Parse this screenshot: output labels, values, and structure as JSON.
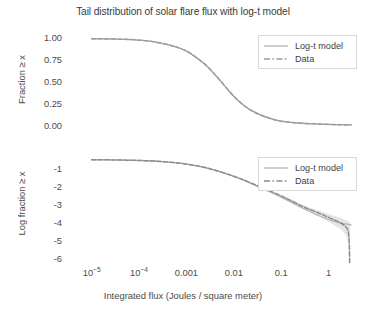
{
  "chart_data": {
    "type": "line",
    "title": "Tail distribution of solar flare flux with log-t model",
    "xlabel": "Integrated flux (Joules / square meter)",
    "xscale": "log",
    "xlim": [
      3.16e-06,
      4.0
    ],
    "xticks": [
      1e-05,
      0.0001,
      0.001,
      0.01,
      0.1,
      1
    ],
    "xticklabels": [
      "10−5",
      "10−4",
      "0.001",
      "0.01",
      "0.1",
      "1"
    ],
    "grid": false,
    "legend_position": "upper right",
    "panels": [
      {
        "name": "linear-tail-distribution",
        "ylabel": "Fraction ≥ x",
        "ylim": [
          -0.04,
          1.06
        ],
        "yticks": [
          0.0,
          0.25,
          0.5,
          0.75,
          1.0
        ],
        "yticklabels": [
          "0.00",
          "0.25",
          "0.50",
          "0.75",
          "1.00"
        ],
        "series": [
          {
            "name": "Log-t model",
            "style": "solid",
            "color": "#b5b5b5",
            "x": [
              1e-05,
              2e-05,
              5e-05,
              0.0001,
              0.0002,
              0.0005,
              0.001,
              0.002,
              0.003,
              0.005,
              0.008,
              0.012,
              0.02,
              0.035,
              0.06,
              0.1,
              0.2,
              0.4,
              0.8,
              1.5,
              3.0
            ],
            "y": [
              0.995,
              0.993,
              0.988,
              0.979,
              0.962,
              0.915,
              0.855,
              0.745,
              0.66,
              0.53,
              0.4,
              0.3,
              0.205,
              0.135,
              0.09,
              0.06,
              0.042,
              0.032,
              0.026,
              0.022,
              0.02
            ]
          },
          {
            "name": "Data",
            "style": "dashed",
            "color": "#9a9a9a",
            "x": [
              1e-05,
              2e-05,
              5e-05,
              0.0001,
              0.0002,
              0.0005,
              0.001,
              0.002,
              0.003,
              0.005,
              0.008,
              0.012,
              0.02,
              0.035,
              0.06,
              0.1,
              0.2,
              0.4,
              0.8,
              1.5,
              3.0
            ],
            "y": [
              0.995,
              0.993,
              0.988,
              0.979,
              0.962,
              0.915,
              0.855,
              0.745,
              0.66,
              0.53,
              0.4,
              0.3,
              0.205,
              0.135,
              0.09,
              0.06,
              0.042,
              0.032,
              0.026,
              0.02,
              0.016
            ]
          }
        ]
      },
      {
        "name": "log-tail-distribution",
        "ylabel": "Log fraction ≥ x",
        "ylim": [
          -6.4,
          -0.25
        ],
        "yticks": [
          -6,
          -5,
          -4,
          -3,
          -2,
          -1
        ],
        "yticklabels": [
          "-6",
          "-5",
          "-4",
          "-3",
          "-2",
          "-1"
        ],
        "series": [
          {
            "name": "Log-t model",
            "style": "solid",
            "color": "#b5b5b5",
            "x": [
              1e-05,
              3e-05,
              0.0001,
              0.0003,
              0.001,
              0.003,
              0.01,
              0.03,
              0.1,
              0.3,
              0.6,
              1.0,
              1.6,
              2.4,
              3.0
            ],
            "y": [
              -0.46,
              -0.47,
              -0.5,
              -0.56,
              -0.7,
              -0.95,
              -1.39,
              -1.92,
              -2.55,
              -3.2,
              -3.56,
              -3.8,
              -3.96,
              -4.06,
              -4.1
            ]
          },
          {
            "name": "Data",
            "style": "dashed",
            "color": "#8c8c8c",
            "x": [
              1e-05,
              3e-05,
              0.0001,
              0.0003,
              0.001,
              0.003,
              0.01,
              0.03,
              0.1,
              0.3,
              0.6,
              1.0,
              1.6,
              2.2,
              2.6,
              2.75,
              2.8
            ],
            "y": [
              -0.46,
              -0.47,
              -0.5,
              -0.56,
              -0.7,
              -0.95,
              -1.38,
              -1.88,
              -2.48,
              -3.1,
              -3.42,
              -3.68,
              -3.92,
              -4.15,
              -4.45,
              -5.2,
              -6.2
            ]
          }
        ],
        "confidence_band": {
          "name": "Data uncertainty band",
          "color": "#cfcfcf",
          "x": [
            0.1,
            0.3,
            0.6,
            1.0,
            1.6,
            2.2,
            2.6,
            2.75,
            2.85
          ],
          "lower": [
            -2.56,
            -3.22,
            -3.6,
            -3.92,
            -4.25,
            -4.6,
            -5.05,
            -5.9,
            -6.4
          ],
          "upper": [
            -2.42,
            -3.0,
            -3.28,
            -3.48,
            -3.66,
            -3.8,
            -3.9,
            -3.95,
            -3.95
          ]
        }
      }
    ]
  },
  "legend": {
    "top": {
      "items": [
        {
          "label": "Log-t model",
          "style": "solid"
        },
        {
          "label": "Data",
          "style": "dashed"
        }
      ]
    },
    "bottom": {
      "items": [
        {
          "label": "Log-t model",
          "style": "solid"
        },
        {
          "label": "Data",
          "style": "dashed"
        }
      ]
    }
  },
  "colors": {
    "model_line": "#b5b5b5",
    "data_line": "#8c8c8c",
    "band": "#cfcfcf",
    "text": "#3f3f3f",
    "background": "#ffffff"
  }
}
